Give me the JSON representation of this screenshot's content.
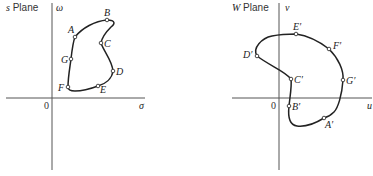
{
  "left_plane": {
    "title": "s Plane",
    "title_prefix": "s",
    "title_suffix": " Plane",
    "x_axis_label": "σ",
    "y_axis_label": "ω",
    "origin_label": "0",
    "points": [
      {
        "name": "A",
        "label": "A"
      },
      {
        "name": "B",
        "label": "B"
      },
      {
        "name": "C",
        "label": "C"
      },
      {
        "name": "D",
        "label": "D"
      },
      {
        "name": "E",
        "label": "E"
      },
      {
        "name": "F",
        "label": "F"
      },
      {
        "name": "G",
        "label": "G"
      }
    ]
  },
  "right_plane": {
    "title": "W Plane",
    "title_prefix": "W",
    "title_suffix": " Plane",
    "x_axis_label": "u",
    "y_axis_label": "v",
    "origin_label": "0",
    "points": [
      {
        "name": "A'",
        "label": "A′"
      },
      {
        "name": "B'",
        "label": "B′"
      },
      {
        "name": "C'",
        "label": "C′"
      },
      {
        "name": "D'",
        "label": "D′"
      },
      {
        "name": "E'",
        "label": "E′"
      },
      {
        "name": "F'",
        "label": "F′"
      },
      {
        "name": "G'",
        "label": "G′"
      }
    ]
  }
}
